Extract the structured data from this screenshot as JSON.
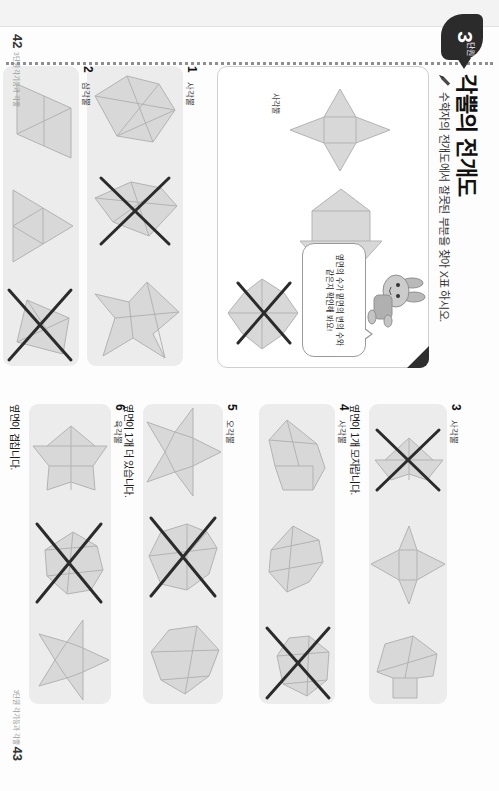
{
  "page": {
    "unit_number": "3",
    "unit_word": "단원",
    "title": "각뿔의 전개도",
    "subline": "수학자의 전개도에서 잘못된 부분을 찾아 X표 하시오.",
    "pencil_icon": "pencil-icon"
  },
  "example": {
    "dogear_icon": "dog-ear-corner",
    "bunny_icon": "bunny-character-icon",
    "bubble_text": "옆면의 수가 밑면의 변의 수와 같은지 확인해 봐요!",
    "captions": [
      {
        "id": "caption-left",
        "text": "사각뿔"
      },
      {
        "id": "caption-right",
        "text": "옆면이 1개 모자랍니다."
      }
    ]
  },
  "problems": [
    {
      "number": "1",
      "label": "사각뿔",
      "note": "",
      "marked_index": 1
    },
    {
      "number": "2",
      "label": "삼각뿔",
      "note": "밑면이 삼각형이 아닙니다.",
      "marked_index": 2
    },
    {
      "number": "3",
      "label": "사각뿔",
      "note": "옆면이 1개 모자랍니다.",
      "marked_index": 0
    },
    {
      "number": "4",
      "label": "사각뿔",
      "note": "옆면이 겹칩니다.",
      "marked_index": 2
    },
    {
      "number": "5",
      "label": "오각뿔",
      "note": "옆면이 1개 더 있습니다.",
      "marked_index": 1
    },
    {
      "number": "6",
      "label": "육각뿔",
      "note": "옆면이 겹칩니다.",
      "marked_index": 1
    }
  ],
  "footer": {
    "left_page": "42",
    "left_caption": "3단원 각기둥과 각뿔",
    "right_page": "43",
    "right_caption": "3단원 각기둥과 각뿔"
  },
  "colors": {
    "ink": "#2b2b2b",
    "strip": "#ececec",
    "net_fill": "#d8d8d8",
    "net_stroke": "#b3b3b3"
  }
}
